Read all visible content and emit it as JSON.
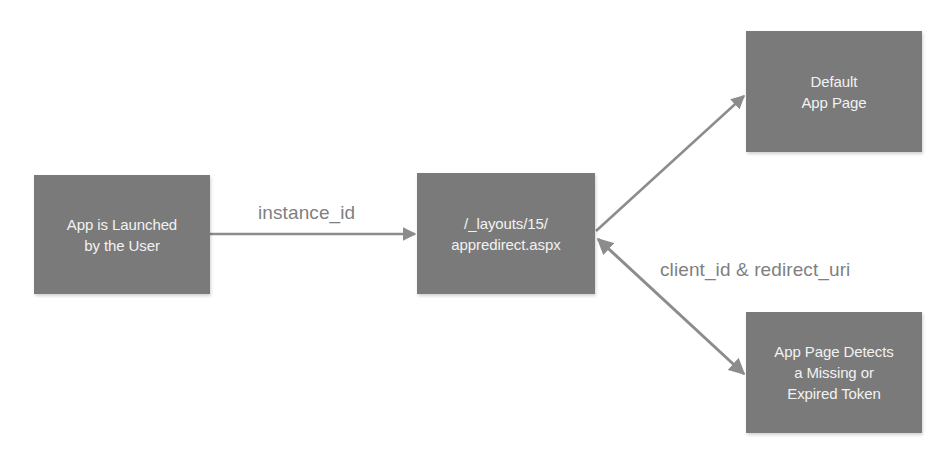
{
  "diagram": {
    "type": "flowchart",
    "colors": {
      "node_fill": "#7a7a7a",
      "node_text": "#f2f2f2",
      "edge": "#8c8c8c",
      "edge_label": "#7f7f7f",
      "background": "#ffffff"
    },
    "nodes": [
      {
        "id": "launch",
        "lines": [
          "App is Launched",
          "by the User"
        ]
      },
      {
        "id": "redirect",
        "lines": [
          "/_layouts/15/",
          "appredirect.aspx"
        ]
      },
      {
        "id": "default",
        "lines": [
          "Default",
          "App Page"
        ]
      },
      {
        "id": "detect",
        "lines": [
          "App Page Detects",
          "a Missing or",
          "Expired Token"
        ]
      }
    ],
    "edges": [
      {
        "from": "launch",
        "to": "redirect",
        "label": "instance_id",
        "direction": "forward"
      },
      {
        "from": "redirect",
        "to": "default",
        "label": "",
        "direction": "forward"
      },
      {
        "from": "redirect",
        "to": "detect",
        "label": "client_id & redirect_uri",
        "direction": "both"
      }
    ]
  }
}
